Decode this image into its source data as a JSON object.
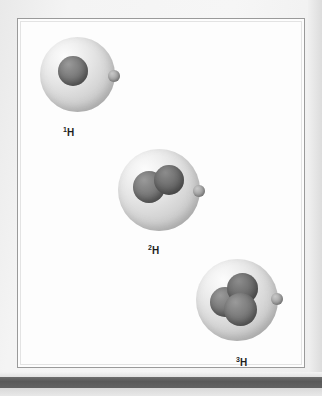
{
  "figure": {
    "panel_background": "#fdfdfd",
    "page_background": "#f1f1f1",
    "border_color": "#9a9a9a"
  },
  "atoms": [
    {
      "id": "protium",
      "label_mass_number": "1",
      "label_symbol": "H",
      "nucleon_count": 1,
      "cloud_color": "#e3e3e3",
      "nucleus_color": "#6e6e6e",
      "electron_color": "#9d9d9d"
    },
    {
      "id": "deuterium",
      "label_mass_number": "2",
      "label_symbol": "H",
      "nucleon_count": 2,
      "cloud_color": "#e3e3e3",
      "nucleus_color": "#6e6e6e",
      "electron_color": "#9d9d9d"
    },
    {
      "id": "tritium",
      "label_mass_number": "3",
      "label_symbol": "H",
      "nucleon_count": 3,
      "cloud_color": "#e3e3e3",
      "nucleus_color": "#6e6e6e",
      "electron_color": "#9d9d9d"
    }
  ]
}
